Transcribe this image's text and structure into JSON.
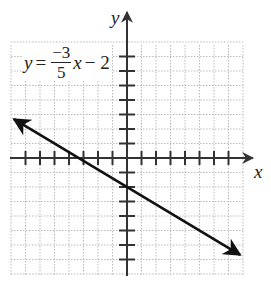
{
  "equation": {
    "lhs": "y",
    "equals": "=",
    "numerator": "−3",
    "denominator": "5",
    "variable": "x",
    "tail": "− 2"
  },
  "axes": {
    "x_label": "x",
    "y_label": "y"
  },
  "colors": {
    "axis": "#333333",
    "line": "#111111",
    "grid": "#bbbbbb"
  },
  "chart_data": {
    "type": "line",
    "xlabel": "x",
    "ylabel": "y",
    "xlim": [
      -8,
      8
    ],
    "ylim": [
      -8,
      8
    ],
    "grid": true,
    "x_ticks": [
      -7,
      -6,
      -5,
      -4,
      -3,
      -2,
      -1,
      1,
      2,
      3,
      4,
      5,
      6,
      7
    ],
    "y_ticks": [
      -7,
      -6,
      -5,
      -4,
      -3,
      -2,
      -1,
      1,
      2,
      3,
      4,
      5,
      6,
      7
    ],
    "slope": -0.6,
    "intercept": -2,
    "series": [
      {
        "name": "y = -3/5 x - 2",
        "x": [
          -7.8,
          7.8
        ],
        "y": [
          2.68,
          -6.68
        ],
        "arrows": "both"
      }
    ]
  }
}
